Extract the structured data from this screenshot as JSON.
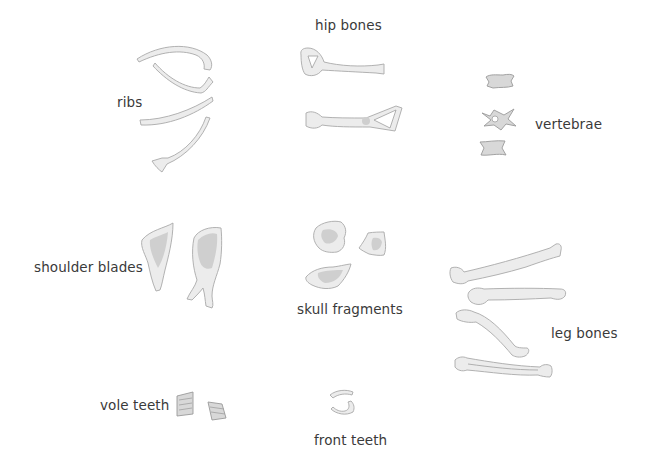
{
  "diagram": {
    "type": "labeled illustration",
    "groups": [
      {
        "id": "ribs",
        "label": "ribs",
        "count": 4
      },
      {
        "id": "hip-bones",
        "label": "hip bones",
        "count": 2
      },
      {
        "id": "vertebrae",
        "label": "vertebrae",
        "count": 3
      },
      {
        "id": "shoulder-blades",
        "label": "shoulder blades",
        "count": 2
      },
      {
        "id": "skull-fragments",
        "label": "skull fragments",
        "count": 3
      },
      {
        "id": "leg-bones",
        "label": "leg bones",
        "count": 4
      },
      {
        "id": "vole-teeth",
        "label": "vole teeth",
        "count": 2
      },
      {
        "id": "front-teeth",
        "label": "front teeth",
        "count": 2
      }
    ]
  },
  "labels": {
    "ribs": "ribs",
    "hip_bones": "hip bones",
    "vertebrae": "vertebrae",
    "shoulder_blades": "shoulder blades",
    "skull_fragments": "skull fragments",
    "leg_bones": "leg bones",
    "vole_teeth": "vole teeth",
    "front_teeth": "front teeth"
  }
}
